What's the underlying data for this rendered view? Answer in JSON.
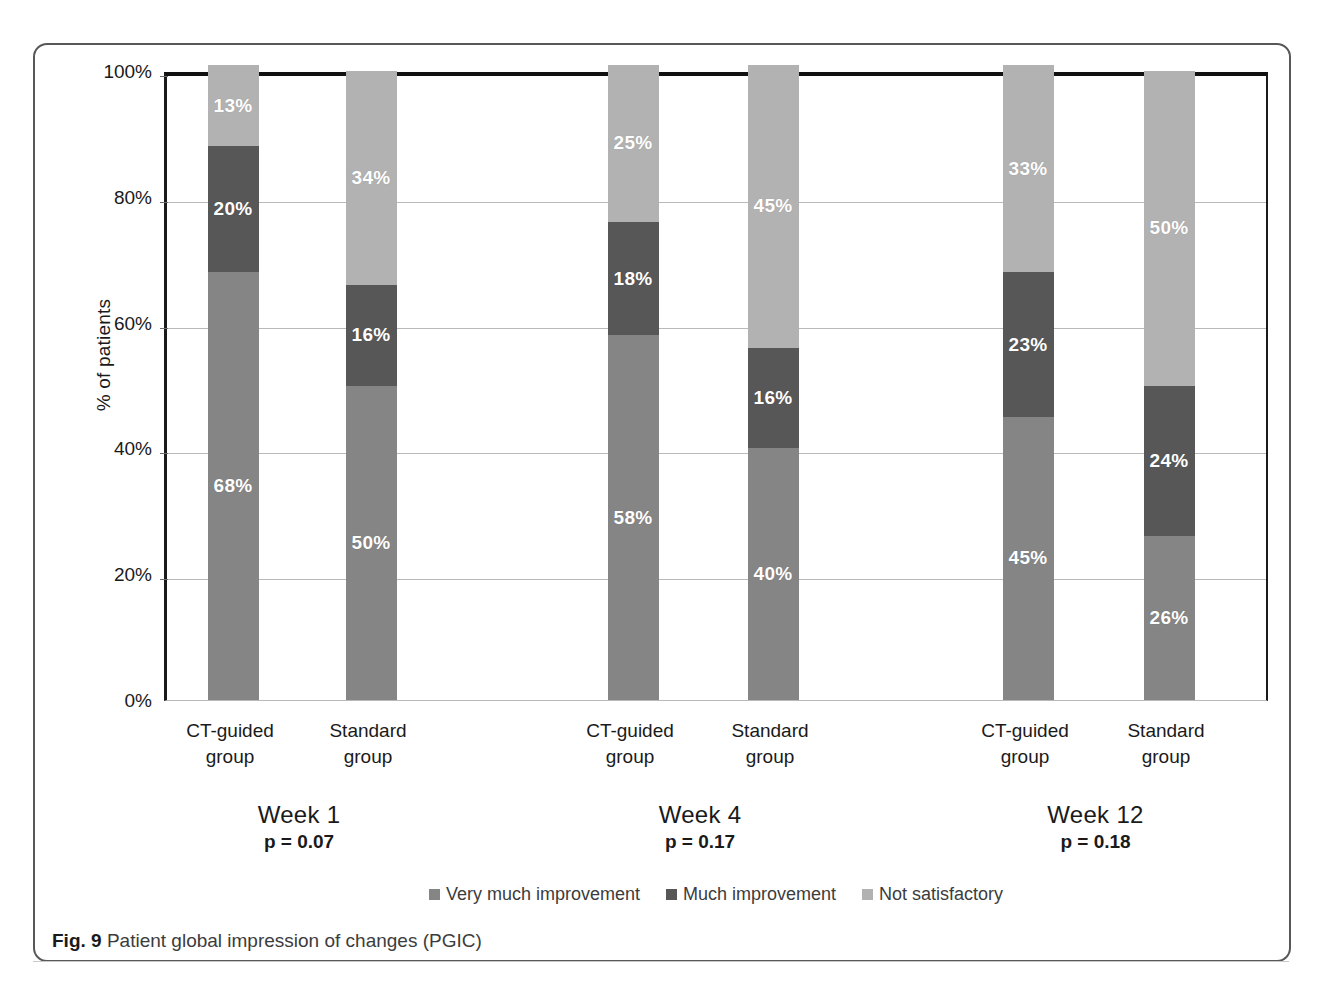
{
  "figure": {
    "caption_prefix": "Fig. 9",
    "caption_text": "Patient global impression of changes (PGIC)"
  },
  "chart_data": {
    "type": "bar",
    "subtype": "stacked-percent",
    "title": "Patient global impression of changes (PGIC)",
    "xlabel": "",
    "ylabel": "% of patients",
    "ylim": [
      0,
      100
    ],
    "yticks": [
      0,
      20,
      40,
      60,
      80,
      100
    ],
    "ytick_labels": [
      "0%",
      "20%",
      "40%",
      "60%",
      "80%",
      "100%"
    ],
    "grid": true,
    "legend_position": "bottom",
    "categories": [
      "Week 1 / CT-guided group",
      "Week 1 / Standard group",
      "Week 4 / CT-guided group",
      "Week 4 / Standard group",
      "Week 12 / CT-guided group",
      "Week 12 / Standard group"
    ],
    "series": [
      {
        "name": "Very much improvement",
        "color": "#858585",
        "values": [
          68,
          50,
          58,
          40,
          45,
          26
        ]
      },
      {
        "name": "Much improvement",
        "color": "#575757",
        "values": [
          20,
          16,
          18,
          16,
          23,
          24
        ]
      },
      {
        "name": "Not satisfactory",
        "color": "#b2b2b2",
        "values": [
          13,
          34,
          25,
          45,
          33,
          50
        ]
      }
    ],
    "groups": [
      {
        "week_label": "Week 1",
        "p_value_label": "p = 0.07",
        "p_value": 0.07,
        "bars": [
          {
            "group_label_line1": "CT-guided",
            "group_label_line2": "group",
            "segments": [
              {
                "series": "Very much improvement",
                "value": 68,
                "label": "68%",
                "color": "#858585"
              },
              {
                "series": "Much improvement",
                "value": 20,
                "label": "20%",
                "color": "#575757"
              },
              {
                "series": "Not satisfactory",
                "value": 13,
                "label": "13%",
                "color": "#b2b2b2"
              }
            ]
          },
          {
            "group_label_line1": "Standard",
            "group_label_line2": "group",
            "segments": [
              {
                "series": "Very much improvement",
                "value": 50,
                "label": "50%",
                "color": "#858585"
              },
              {
                "series": "Much improvement",
                "value": 16,
                "label": "16%",
                "color": "#575757"
              },
              {
                "series": "Not satisfactory",
                "value": 34,
                "label": "34%",
                "color": "#b2b2b2"
              }
            ]
          }
        ]
      },
      {
        "week_label": "Week 4",
        "p_value_label": "p = 0.17",
        "p_value": 0.17,
        "bars": [
          {
            "group_label_line1": "CT-guided",
            "group_label_line2": "group",
            "segments": [
              {
                "series": "Very much improvement",
                "value": 58,
                "label": "58%",
                "color": "#858585"
              },
              {
                "series": "Much improvement",
                "value": 18,
                "label": "18%",
                "color": "#575757"
              },
              {
                "series": "Not satisfactory",
                "value": 25,
                "label": "25%",
                "color": "#b2b2b2"
              }
            ]
          },
          {
            "group_label_line1": "Standard",
            "group_label_line2": "group",
            "segments": [
              {
                "series": "Very much improvement",
                "value": 40,
                "label": "40%",
                "color": "#858585"
              },
              {
                "series": "Much improvement",
                "value": 16,
                "label": "16%",
                "color": "#575757"
              },
              {
                "series": "Not satisfactory",
                "value": 45,
                "label": "45%",
                "color": "#b2b2b2"
              }
            ]
          }
        ]
      },
      {
        "week_label": "Week 12",
        "p_value_label": "p = 0.18",
        "p_value": 0.18,
        "bars": [
          {
            "group_label_line1": "CT-guided",
            "group_label_line2": "group",
            "segments": [
              {
                "series": "Very much improvement",
                "value": 45,
                "label": "45%",
                "color": "#858585"
              },
              {
                "series": "Much improvement",
                "value": 23,
                "label": "23%",
                "color": "#575757"
              },
              {
                "series": "Not satisfactory",
                "value": 33,
                "label": "33%",
                "color": "#b2b2b2"
              }
            ]
          },
          {
            "group_label_line1": "Standard",
            "group_label_line2": "group",
            "segments": [
              {
                "series": "Very much improvement",
                "value": 26,
                "label": "26%",
                "color": "#858585"
              },
              {
                "series": "Much improvement",
                "value": 24,
                "label": "24%",
                "color": "#575757"
              },
              {
                "series": "Not satisfactory",
                "value": 50,
                "label": "50%",
                "color": "#b2b2b2"
              }
            ]
          }
        ]
      }
    ],
    "legend": [
      {
        "label": "Very much improvement",
        "color": "#858585"
      },
      {
        "label": "Much improvement",
        "color": "#575757"
      },
      {
        "label": "Not satisfactory",
        "color": "#b2b2b2"
      }
    ]
  }
}
